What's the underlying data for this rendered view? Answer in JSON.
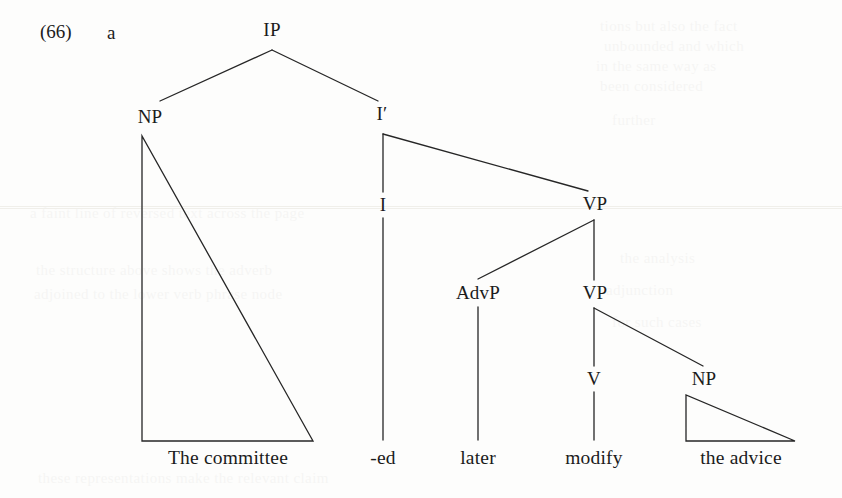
{
  "example": {
    "number": "(66)",
    "letter": "a"
  },
  "tree": {
    "nodes": [
      {
        "id": "IP",
        "label": "IP",
        "x": 272,
        "y": 30
      },
      {
        "id": "NP1",
        "label": "NP",
        "x": 150,
        "y": 117
      },
      {
        "id": "Ibar",
        "label": "I′",
        "x": 382,
        "y": 114
      },
      {
        "id": "I",
        "label": "I",
        "x": 383,
        "y": 205
      },
      {
        "id": "VP1",
        "label": "VP",
        "x": 595,
        "y": 204
      },
      {
        "id": "AdvP",
        "label": "AdvP",
        "x": 478,
        "y": 293
      },
      {
        "id": "VP2",
        "label": "VP",
        "x": 595,
        "y": 293
      },
      {
        "id": "V",
        "label": "V",
        "x": 594,
        "y": 379
      },
      {
        "id": "NP2",
        "label": "NP",
        "x": 704,
        "y": 379
      }
    ],
    "terminals": [
      {
        "id": "t-subject",
        "label": "The committee",
        "x": 228,
        "y": 447
      },
      {
        "id": "t-tense",
        "label": "-ed",
        "x": 383,
        "y": 447
      },
      {
        "id": "t-adverb",
        "label": "later",
        "x": 478,
        "y": 447
      },
      {
        "id": "t-verb",
        "label": "modify",
        "x": 594,
        "y": 447
      },
      {
        "id": "t-object",
        "label": "the advice",
        "x": 741,
        "y": 447
      }
    ],
    "edges": [
      {
        "id": "edge-ip-np",
        "from": "IP",
        "to": "NP1",
        "x1": 272,
        "y1": 50,
        "x2": 160,
        "y2": 101
      },
      {
        "id": "edge-ip-ibar",
        "from": "IP",
        "to": "Ibar",
        "x1": 272,
        "y1": 50,
        "x2": 378,
        "y2": 101
      },
      {
        "id": "edge-ibar-i",
        "from": "Ibar",
        "to": "I",
        "x1": 383,
        "y1": 134,
        "x2": 383,
        "y2": 192
      },
      {
        "id": "edge-ibar-vp",
        "from": "Ibar",
        "to": "VP1",
        "x1": 383,
        "y1": 134,
        "x2": 588,
        "y2": 191
      },
      {
        "id": "edge-vp-advp",
        "from": "VP1",
        "to": "AdvP",
        "x1": 594,
        "y1": 220,
        "x2": 478,
        "y2": 279
      },
      {
        "id": "edge-vp-vp",
        "from": "VP1",
        "to": "VP2",
        "x1": 594,
        "y1": 220,
        "x2": 594,
        "y2": 280
      },
      {
        "id": "edge-vp2-v",
        "from": "VP2",
        "to": "V",
        "x1": 594,
        "y1": 308,
        "x2": 594,
        "y2": 366
      },
      {
        "id": "edge-vp2-np",
        "from": "VP2",
        "to": "NP2",
        "x1": 594,
        "y1": 308,
        "x2": 703,
        "y2": 366
      },
      {
        "id": "edge-i-tense",
        "from": "I",
        "to": "t-tense",
        "x1": 383,
        "y1": 218,
        "x2": 383,
        "y2": 440
      },
      {
        "id": "edge-advp-later",
        "from": "AdvP",
        "to": "t-adverb",
        "x1": 478,
        "y1": 307,
        "x2": 478,
        "y2": 440
      },
      {
        "id": "edge-v-modify",
        "from": "V",
        "to": "t-verb",
        "x1": 594,
        "y1": 392,
        "x2": 594,
        "y2": 440
      }
    ],
    "triangles": [
      {
        "id": "triangle-subject",
        "covers": "The committee",
        "apex_x": 142,
        "apex_y": 136,
        "left_x": 142,
        "right_x": 313,
        "base_y": 441
      },
      {
        "id": "triangle-object",
        "covers": "the advice",
        "apex_x": 686,
        "apex_y": 395,
        "left_x": 686,
        "right_x": 795,
        "base_y": 441
      }
    ],
    "stroke_color": "#262626",
    "stroke_width": 1.3
  },
  "background": {
    "page_color": "#fdfdfc",
    "bleed_through": [
      {
        "x": 600,
        "y": 18,
        "text": "tions but also the fact"
      },
      {
        "x": 604,
        "y": 38,
        "text": "unbounded and which"
      },
      {
        "x": 596,
        "y": 58,
        "text": "in the same way as"
      },
      {
        "x": 600,
        "y": 78,
        "text": "been considered"
      },
      {
        "x": 30,
        "y": 205,
        "text": "a faint line of reversed text across the page"
      },
      {
        "x": 612,
        "y": 112,
        "text": "further"
      },
      {
        "x": 36,
        "y": 262,
        "text": "the structure above shows the adverb"
      },
      {
        "x": 34,
        "y": 286,
        "text": "adjoined to the lower verb phrase node"
      },
      {
        "x": 620,
        "y": 250,
        "text": "the analysis"
      },
      {
        "x": 606,
        "y": 282,
        "text": "adjunction"
      },
      {
        "x": 612,
        "y": 314,
        "text": "for such cases"
      },
      {
        "x": 38,
        "y": 470,
        "text": "these representations make the relevant claim"
      }
    ]
  }
}
